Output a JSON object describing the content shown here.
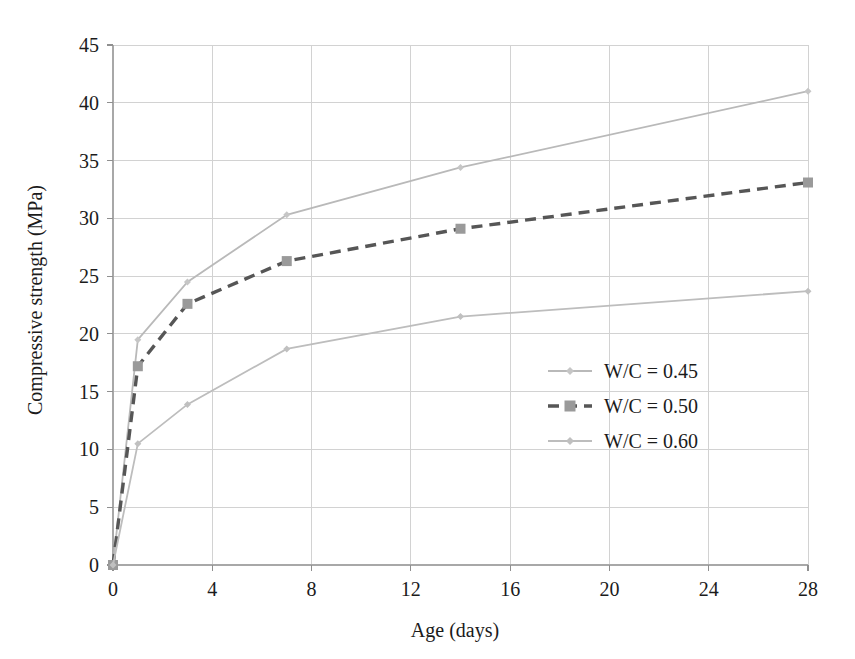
{
  "chart_data": {
    "type": "line",
    "title": "",
    "xlabel": "Age (days)",
    "ylabel": "Compressive strength (MPa)",
    "xlim": [
      0,
      28
    ],
    "ylim": [
      0,
      45
    ],
    "xticks": [
      0,
      4,
      8,
      12,
      16,
      20,
      24,
      28
    ],
    "yticks": [
      0,
      5,
      10,
      15,
      20,
      25,
      30,
      35,
      40,
      45
    ],
    "xtick_labels": [
      "0",
      "4",
      "8",
      "12",
      "16",
      "20",
      "24",
      "28"
    ],
    "ytick_labels": [
      "0",
      "5",
      "10",
      "15",
      "20",
      "25",
      "30",
      "35",
      "40",
      "45"
    ],
    "grid": true,
    "legend_position": "center-right",
    "x": [
      0,
      1,
      3,
      7,
      14,
      28
    ],
    "series": [
      {
        "name": "W/C = 0.45",
        "values": [
          0,
          19.5,
          24.5,
          30.3,
          34.4,
          41.0
        ],
        "color": "#b9b9b9",
        "dash": "none",
        "marker": "diamond",
        "marker_color": "#c6c6c6"
      },
      {
        "name": "W/C = 0.50",
        "values": [
          0,
          17.2,
          22.6,
          26.3,
          29.1,
          33.1
        ],
        "color": "#565656",
        "dash": "dashed",
        "marker": "square",
        "marker_color": "#9a9a9a"
      },
      {
        "name": "W/C = 0.60",
        "values": [
          0,
          10.5,
          13.9,
          18.7,
          21.5,
          23.7
        ],
        "color": "#bdbdbd",
        "dash": "none",
        "marker": "diamond",
        "marker_color": "#c0c0c0"
      }
    ]
  },
  "legend": {
    "entries": [
      {
        "label": "W/C = 0.45"
      },
      {
        "label": "W/C = 0.50"
      },
      {
        "label": "W/C = 0.60"
      }
    ]
  },
  "axes": {
    "x_title": "Age (days)",
    "y_title": "Compressive strength (MPa)"
  }
}
